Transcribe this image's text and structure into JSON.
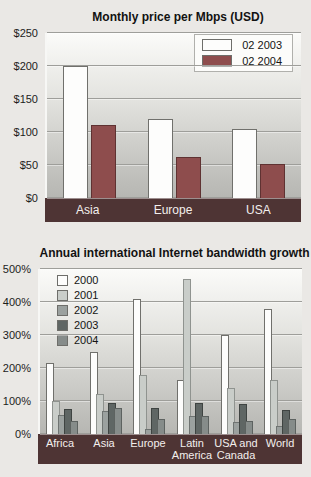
{
  "page": {
    "background": "#eae8e5",
    "band_color": "#4e3434"
  },
  "chart_data": [
    {
      "type": "bar",
      "title": "Monthly price per Mbps (USD)",
      "categories": [
        "Asia",
        "Europe",
        "USA"
      ],
      "series": [
        {
          "name": "02 2003",
          "color": "#fdfdfc",
          "border": "#70706c",
          "values": [
            200,
            120,
            105
          ]
        },
        {
          "name": "02 2004",
          "color": "#8e4d4d",
          "border": "#5f3232",
          "values": [
            110,
            62,
            52
          ]
        }
      ],
      "ymax": 250,
      "ylim": [
        0,
        250
      ],
      "y_ticks": [
        "$250",
        "$200",
        "$150",
        "$100",
        "$50",
        "$0"
      ],
      "grid": "on",
      "legend_position": "top-right"
    },
    {
      "type": "bar",
      "title": "Annual international Internet bandwidth growth",
      "categories": [
        "Africa",
        "Asia",
        "Europe",
        "Latin America",
        "USA and Canada",
        "World"
      ],
      "series": [
        {
          "name": "2000",
          "color": "#fdfdfc",
          "border": "#70706c",
          "values": [
            215,
            250,
            410,
            165,
            300,
            380
          ]
        },
        {
          "name": "2001",
          "color": "#c9cdc9",
          "border": "#8f938f",
          "values": [
            100,
            120,
            180,
            470,
            140,
            165
          ]
        },
        {
          "name": "2002",
          "color": "#9ba19f",
          "border": "#6f7472",
          "values": [
            58,
            70,
            15,
            55,
            35,
            25
          ]
        },
        {
          "name": "2003",
          "color": "#5f6664",
          "border": "#3f4442",
          "values": [
            75,
            95,
            78,
            95,
            92,
            72
          ]
        },
        {
          "name": "2004",
          "color": "#868c8a",
          "border": "#5d6260",
          "values": [
            40,
            80,
            45,
            55,
            38,
            45
          ]
        }
      ],
      "ymax": 500,
      "ylim": [
        0,
        500
      ],
      "y_ticks": [
        "500%",
        "400%",
        "300%",
        "200%",
        "100%",
        "0%"
      ],
      "grid": "on",
      "legend_position": "top-left"
    }
  ]
}
